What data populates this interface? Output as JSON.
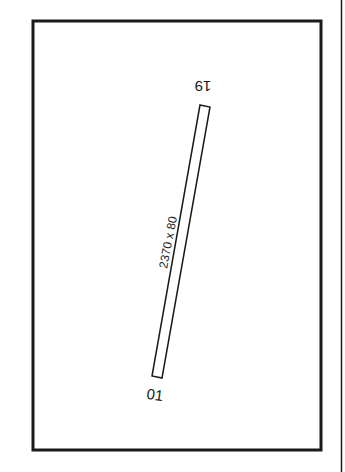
{
  "diagram": {
    "type": "airport-runway-diagram",
    "runway": {
      "dimensions_label": "2370 x 80",
      "end_north_label": "19",
      "end_south_label": "01"
    },
    "colors": {
      "line": "#1a1a1a",
      "background": "#ffffff"
    }
  }
}
